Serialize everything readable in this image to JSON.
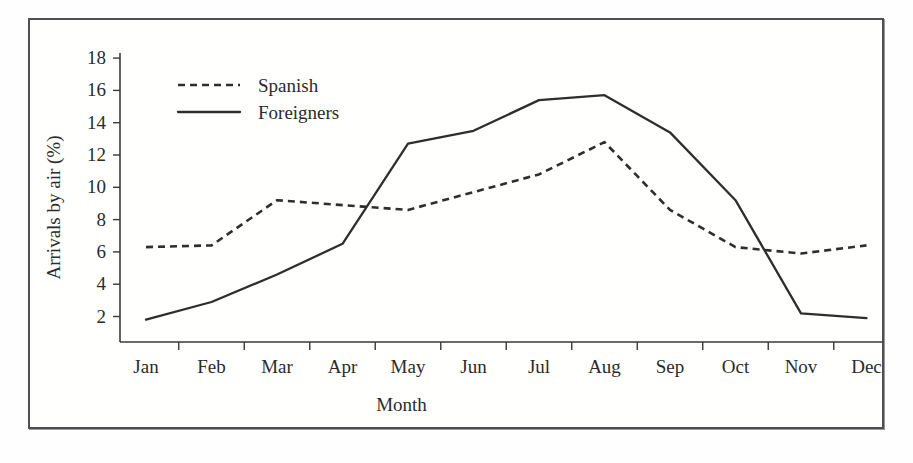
{
  "figure": {
    "frame_color": "#4f4f4f",
    "background": "#ffffff"
  },
  "chart_data": {
    "type": "line",
    "title": "",
    "subtitle": "",
    "xlabel": "Month",
    "ylabel": "Arrivals by air (%)",
    "categories": [
      "Jan",
      "Feb",
      "Mar",
      "Apr",
      "May",
      "Jun",
      "Jul",
      "Aug",
      "Sep",
      "Oct",
      "Nov",
      "Dec"
    ],
    "ylim": [
      0,
      18
    ],
    "yticks": [
      2,
      4,
      6,
      8,
      10,
      12,
      14,
      16,
      18
    ],
    "ytick_labels": [
      "2",
      "4",
      "6",
      "8",
      "10",
      "12",
      "14",
      "16",
      "18"
    ],
    "grid": false,
    "legend_position": "top-left-inside",
    "series": [
      {
        "name": "Spanish",
        "style": "dashed",
        "color": "#2e2e2e",
        "values": [
          6.3,
          6.4,
          9.2,
          8.9,
          8.6,
          9.7,
          10.8,
          12.8,
          8.6,
          6.3,
          5.9,
          6.4
        ]
      },
      {
        "name": "Foreigners",
        "style": "solid",
        "color": "#2e2e2e",
        "values": [
          1.8,
          2.9,
          4.6,
          6.5,
          12.7,
          13.5,
          15.4,
          15.7,
          13.4,
          9.2,
          2.2,
          1.9
        ]
      }
    ]
  },
  "legend": {
    "entries": [
      {
        "label": "Spanish",
        "style": "dashed"
      },
      {
        "label": "Foreigners",
        "style": "solid"
      }
    ]
  }
}
